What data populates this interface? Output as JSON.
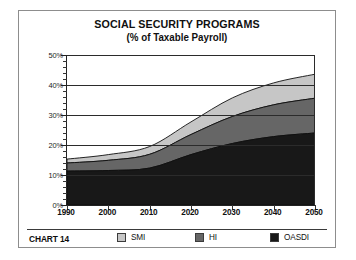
{
  "chart_data": {
    "type": "area",
    "stacked": true,
    "title": "SOCIAL SECURITY PROGRAMS",
    "subtitle": "(% of Taxable Payroll)",
    "chart_number": "CHART 14",
    "xlabel": "",
    "ylabel": "",
    "xlim": [
      1990,
      2050
    ],
    "ylim": [
      0,
      50
    ],
    "grid": true,
    "legend_position": "bottom",
    "x": [
      1990,
      2000,
      2010,
      2020,
      2030,
      2040,
      2050
    ],
    "xticklabels": [
      "1990",
      "2000",
      "2010",
      "2020",
      "2030",
      "2040",
      "2050"
    ],
    "yticklabels": [
      "0%",
      "10%",
      "20%",
      "30%",
      "40%",
      "50%"
    ],
    "ytickvalues": [
      0,
      10,
      20,
      30,
      40,
      50
    ],
    "yminor_step": 2,
    "series": [
      {
        "name": "OASDI",
        "color": "#181818",
        "values": [
          11.3,
          11.5,
          12.3,
          16.8,
          20.5,
          22.8,
          24.0
        ]
      },
      {
        "name": "HI",
        "color": "#666666",
        "values": [
          2.7,
          3.4,
          4.6,
          6.7,
          9.0,
          10.6,
          11.6
        ]
      },
      {
        "name": "SMI",
        "color": "#c6c6c6",
        "values": [
          1.3,
          1.9,
          2.6,
          4.2,
          6.2,
          7.3,
          8.0
        ]
      }
    ],
    "cumulative_tops": {
      "OASDI": [
        11.3,
        11.5,
        12.3,
        16.8,
        20.5,
        22.8,
        24.0
      ],
      "HI": [
        14.0,
        14.9,
        16.9,
        23.5,
        29.5,
        33.4,
        35.6
      ],
      "SMI": [
        15.3,
        16.8,
        19.5,
        27.7,
        35.7,
        40.7,
        43.6
      ]
    }
  },
  "legend": {
    "chart_number": "CHART 14",
    "items": [
      {
        "label": "SMI",
        "color": "#c6c6c6"
      },
      {
        "label": "HI",
        "color": "#666666"
      },
      {
        "label": "OASDI",
        "color": "#181818"
      }
    ]
  }
}
